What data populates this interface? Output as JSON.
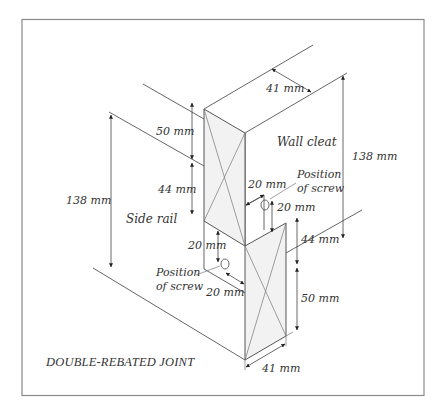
{
  "diagram": {
    "title": "DOUBLE-REBATED JOINT",
    "parts": {
      "wall_cleat": "Wall cleat",
      "side_rail": "Side rail"
    },
    "screw_labels": {
      "upper_line1": "Position",
      "upper_line2": "of screw",
      "lower_line1": "Position",
      "lower_line2": "of screw"
    },
    "dimensions": {
      "top_width": "41 mm",
      "wall_cleat_height": "138 mm",
      "side_rail_height": "138 mm",
      "upper_rebate_top": "50 mm",
      "upper_rebate_bottom": "44 mm",
      "upper_screw_horizontal": "20 mm",
      "upper_screw_vertical": "20 mm",
      "lower_screw_vertical": "20 mm",
      "lower_screw_horizontal": "20 mm",
      "lower_rebate_top": "44 mm",
      "lower_rebate_bottom": "50 mm",
      "bottom_width": "41 mm"
    },
    "colors": {
      "frame": "#8a8a8a",
      "line": "#555555",
      "face_fill": "#f2f2f2",
      "text": "#333333"
    }
  }
}
